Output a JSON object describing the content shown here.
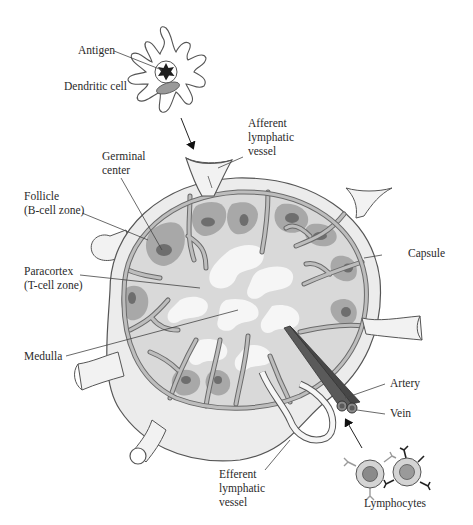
{
  "figure": {
    "labels": {
      "antigen": "Antigen",
      "dendritic_cell": "Dendritic cell",
      "afferent_1": "Afferent",
      "afferent_2": "lymphatic",
      "afferent_3": "vessel",
      "germinal_1": "Germinal",
      "germinal_2": "center",
      "follicle_1": "Follicle",
      "follicle_2": "(B-cell zone)",
      "paracortex_1": "Paracortex",
      "paracortex_2": "(T-cell zone)",
      "medulla": "Medulla",
      "capsule": "Capsule",
      "artery": "Artery",
      "vein": "Vein",
      "efferent_1": "Efferent",
      "efferent_2": "lymphatic",
      "efferent_3": "vessel",
      "lymphocytes": "Lymphocytes"
    },
    "colors": {
      "background": "#ffffff",
      "capsule_fill": "#ececec",
      "cortex_light": "#d9d9d9",
      "medulla_white": "#f6f6f6",
      "follicle": "#a8a8a8",
      "germinal_center": "#6e6e6e",
      "trabeculae": "#bdbdbd",
      "outline": "#555555",
      "blood_vessel": "#5a5a5a",
      "antigen": "#1e1e1e",
      "dendritic_nucleus": "#9a9a9a",
      "lymphocyte_body": "#d4d4d4",
      "lymphocyte_nucleus": "#8a8a8a"
    }
  }
}
